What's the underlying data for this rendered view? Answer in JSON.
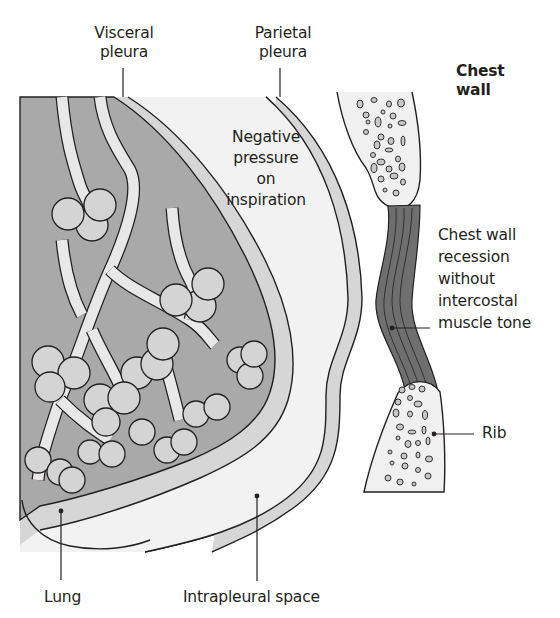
{
  "figure": {
    "labels": {
      "visceral_pleura": [
        "Visceral",
        "pleura"
      ],
      "parietal_pleura": [
        "Parietal",
        "pleura"
      ],
      "chest_wall": [
        "Chest",
        "wall"
      ],
      "negative_pressure": [
        "Negative",
        "pressure",
        "on",
        "inspiration"
      ],
      "chest_wall_recession": [
        "Chest wall",
        "recession",
        "without",
        "intercostal",
        "muscle tone"
      ],
      "rib": "Rib",
      "lung": "Lung",
      "intrapleural_space": "Intrapleural space"
    },
    "colors": {
      "background_panel": "#ececec",
      "lung_tissue": "#a9a9a9",
      "pleura_layer": "#d6d6d6",
      "intrapleural_space": "#f2f2f2",
      "bone": "#f0f0f0",
      "muscle": "#6f6f6f",
      "airway": "#e8e8e8",
      "alveoli": "#d4d4d4",
      "outline": "#231f20"
    }
  }
}
